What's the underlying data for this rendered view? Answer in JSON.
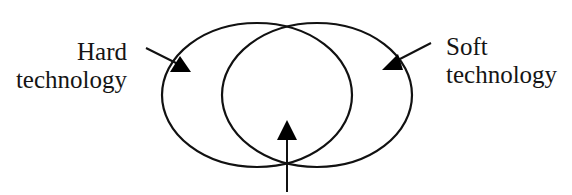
{
  "diagram": {
    "type": "venn",
    "stroke_color": "#111111",
    "background": "#ffffff",
    "sets": [
      {
        "id": "hard",
        "label_lines": [
          "Hard",
          "technology"
        ],
        "ellipse": {
          "cx": 257,
          "cy": 95,
          "rx": 95,
          "ry": 72
        }
      },
      {
        "id": "soft",
        "label_lines": [
          "Soft",
          "technology"
        ],
        "ellipse": {
          "cx": 317,
          "cy": 95,
          "rx": 95,
          "ry": 72
        }
      }
    ],
    "pointers": [
      {
        "target": "hard",
        "from": [
          146,
          48
        ],
        "to": [
          183,
          68
        ],
        "head": "triangle"
      },
      {
        "target": "soft",
        "from": [
          431,
          43
        ],
        "to": [
          396,
          64
        ],
        "head": "triangle"
      },
      {
        "target": "intersection",
        "from": [
          287,
          192
        ],
        "to": [
          287,
          125
        ],
        "head": "triangle",
        "label": ""
      }
    ]
  },
  "labels": {
    "hard_line1": "Hard",
    "hard_line2": "technology",
    "soft_line1": "Soft",
    "soft_line2": "technology"
  }
}
